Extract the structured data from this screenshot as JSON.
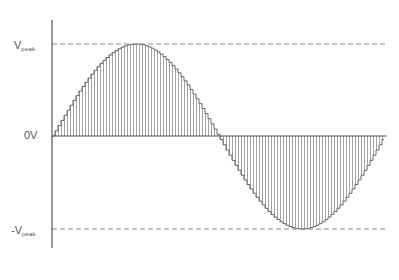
{
  "diagram": {
    "type": "sampled-sine-wave",
    "labels": {
      "vpeak_main": "V",
      "vpeak_sub": "peak",
      "zero": "0V",
      "neg_vpeak_main": "-V",
      "neg_vpeak_sub": "peak"
    },
    "colors": {
      "axis": "#555555",
      "wave": "#666666",
      "hatch": "#8a8a8a",
      "reference_dash": "#888888",
      "label": "#555555"
    },
    "geometry": {
      "axis_x": 52,
      "axis_top": 20,
      "axis_bottom": 248,
      "zero_y": 136,
      "peak_y": 44,
      "trough_y": 229,
      "wave_start_x": 52,
      "wave_end_x": 384,
      "axis_end_x": 387,
      "sample_spacing": 3,
      "dash_end_x": 386
    }
  }
}
